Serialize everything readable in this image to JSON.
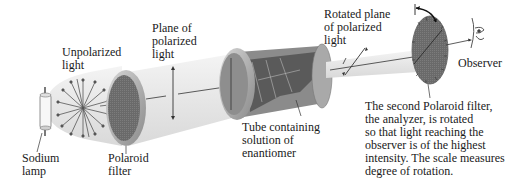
{
  "diagram": {
    "labels": {
      "sodium_lamp": "Sodium\nlamp",
      "unpolarized_light": "Unpolarized\nlight",
      "polaroid_filter": "Polaroid\nfilter",
      "plane_polarized": "Plane of\npolarized\nlight",
      "tube": "Tube containing\nsolution of\nenantiomer",
      "rotated_plane": "Rotated plane\nof polarized\nlight",
      "observer": "Observer",
      "analyzer_caption": "The second Polaroid filter,\nthe analyzer, is rotated\nso that light reaching the\nobserver is of the highest\nintensity. The scale measures\ndegree of rotation."
    },
    "colors": {
      "beam": "#e9e9e9",
      "beam_edge": "#cfcfcf",
      "filter_dark": "#6e6e6e",
      "filter_rim": "#bdbdbd",
      "tube_body": "#8a8a8a",
      "text": "#1a1a1a"
    },
    "components": [
      "sodium-lamp",
      "polaroid-filter",
      "sample-tube",
      "analyzer",
      "observer-eye"
    ]
  }
}
